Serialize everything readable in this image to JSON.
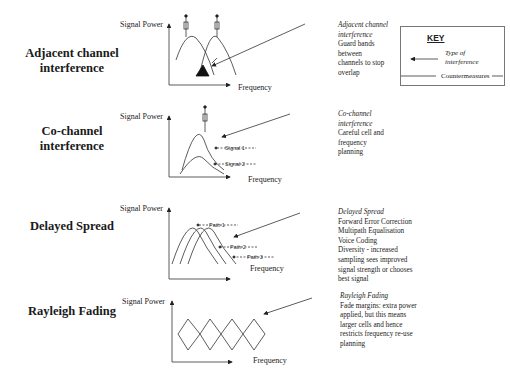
{
  "diagram": {
    "axis": {
      "y_label": "Signal Power",
      "x_label": "Frequency"
    },
    "rows": [
      {
        "title_line1": "Adjacent channel",
        "title_line2": "interference",
        "note_title": "Adjacent channel interference",
        "note_lines": [
          "Guard bands",
          "between",
          "channels to stop",
          "overlap"
        ]
      },
      {
        "title_line1": "Co-channel",
        "title_line2": "interference",
        "note_title": "Co-channel interference",
        "note_lines": [
          "Careful cell and",
          "frequency",
          "planning"
        ],
        "signals": [
          "Signal 1",
          "Signal 2"
        ]
      },
      {
        "title_line1": "Delayed Spread",
        "note_title": "Delayed Spread",
        "note_lines": [
          "Forward Error Correction",
          "Multipath Equalisation",
          "Voice Coding",
          "Diversity - increased",
          "sampling sees improved",
          "signal strength or chooses",
          "best signal"
        ],
        "paths": [
          "Path 1",
          "Path 2",
          "Path 3"
        ]
      },
      {
        "title_line1": "Rayleigh Fading",
        "note_title": "Rayleigh Fading",
        "note_lines": [
          "Fade margins: extra power",
          "applied, but this means",
          "larger cells and hence",
          "restricts frequency re-use",
          "planning"
        ]
      }
    ],
    "key": {
      "title": "KEY",
      "arrow_meaning": "Type of interference",
      "line_meaning": "Countermeasures"
    }
  }
}
